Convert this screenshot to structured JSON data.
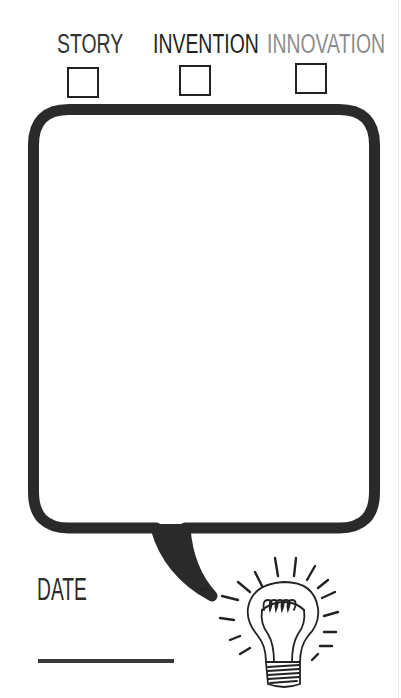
{
  "categories": [
    {
      "label": "STORY",
      "color": "#333333",
      "checked": false
    },
    {
      "label": "INVENTION",
      "color": "#222222",
      "checked": false
    },
    {
      "label": "INNOVATION",
      "color": "#8c8c8c",
      "checked": false
    }
  ],
  "speech_bubble": {
    "content": "",
    "stroke_color": "#2a2a2a"
  },
  "date": {
    "label": "DATE",
    "value": ""
  },
  "illustration": {
    "name": "light-bulb"
  }
}
